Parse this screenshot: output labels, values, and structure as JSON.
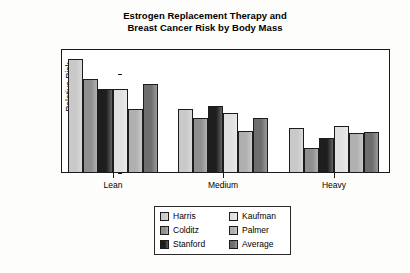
{
  "chart_data": {
    "type": "bar",
    "title": "Estrogen Replacement Therapy and Breast Cancer Risk by Body Mass",
    "title_lines": [
      "Estrogen Replacement Therapy and",
      "Breast Cancer Risk by Body Mass"
    ],
    "xlabel": "",
    "ylabel": "Relative Risk",
    "categories": [
      "Lean",
      "Medium",
      "Heavy"
    ],
    "ylim": [
      0,
      2.5
    ],
    "yticks": [
      0,
      0.5,
      1,
      1.5,
      2,
      2.5
    ],
    "ytick_labels": [
      "0",
      "0.5",
      "1",
      "1.5",
      "2",
      "2.5"
    ],
    "grid": false,
    "legend_position": "bottom-center",
    "series": [
      {
        "name": "Harris",
        "color": "#c9c9c9",
        "values": [
          2.3,
          1.3,
          0.9
        ]
      },
      {
        "name": "Colditz",
        "color": "#8f8f8f",
        "values": [
          1.9,
          1.1,
          0.5
        ]
      },
      {
        "name": "Stanford",
        "color": "#1e1e1e",
        "values": [
          1.7,
          1.35,
          0.7
        ]
      },
      {
        "name": "Kaufman",
        "color": "#e0e0e0",
        "values": [
          1.7,
          1.2,
          0.95
        ]
      },
      {
        "name": "Palmer",
        "color": "#b0b0b0",
        "values": [
          1.3,
          0.85,
          0.8
        ]
      },
      {
        "name": "Average",
        "color": "#6e6e6e",
        "values": [
          1.8,
          1.1,
          0.82
        ]
      }
    ]
  },
  "legend": {
    "columns": [
      [
        "Harris",
        "Colditz",
        "Stanford"
      ],
      [
        "Kaufman",
        "Palmer",
        "Average"
      ]
    ]
  }
}
